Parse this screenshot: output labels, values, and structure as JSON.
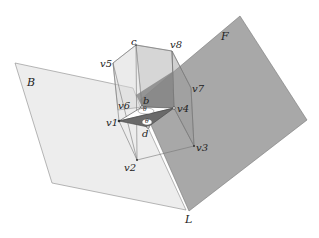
{
  "diagram": {
    "planes": [
      {
        "name": "B",
        "label": "B",
        "fill": "#ececec"
      },
      {
        "name": "F",
        "label": "F",
        "fill": "#a9a9a9"
      }
    ],
    "line_label": "L",
    "vertices": {
      "v1": "v1",
      "v2": "v2",
      "v3": "v3",
      "v4": "v4",
      "v5": "v5",
      "v6": "v6",
      "v7": "v7",
      "v8": "v8"
    },
    "points": {
      "b": "b",
      "c": "c",
      "d": "d"
    },
    "angles": {
      "top": "θ",
      "bottom": "θ"
    }
  }
}
